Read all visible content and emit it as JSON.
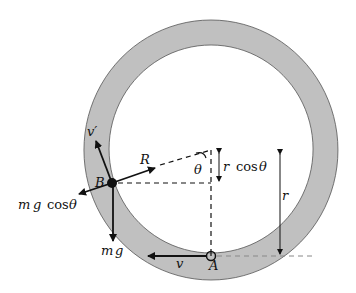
{
  "figure": {
    "type": "physics-diagram"
  },
  "colors": {
    "ring_fill": "#c0c0c0",
    "ring_edge": "#555555",
    "line": "#111111",
    "dash_gray": "#888888",
    "background": "#ffffff"
  },
  "labels": {
    "v_prime": "v′",
    "R": "R",
    "B": "B",
    "theta": "θ",
    "r_cos_theta_r": "r",
    "r_cos_theta_cos": "cos",
    "r_cos_theta_theta": "θ",
    "mg_cos_theta_m": "m",
    "mg_cos_theta_g": "g",
    "mg_cos_theta_cos": "cos",
    "mg_cos_theta_theta": "θ",
    "r": "r",
    "mg_m": "m",
    "mg_g": "g",
    "v": "v",
    "A": "A"
  },
  "points": {
    "center": [
      211,
      150
    ],
    "B": [
      112,
      183
    ],
    "A": [
      211,
      256
    ]
  }
}
